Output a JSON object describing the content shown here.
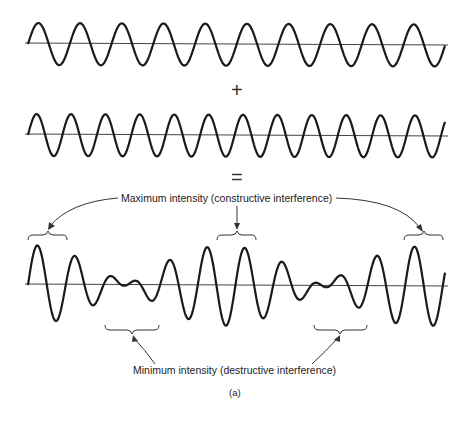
{
  "figure": {
    "operator_plus": "+",
    "operator_equals": "=",
    "max_label": "Maximum intensity (constructive interference)",
    "min_label": "Minimum intensity (destructive interference)",
    "caption": "(a)"
  },
  "waves": {
    "x_start": 28,
    "x_end": 445,
    "wave1": {
      "baseline_y": 44,
      "amplitude": 21,
      "period": 41.7
    },
    "wave2": {
      "baseline_y": 135,
      "amplitude": 21,
      "period": 34.4
    },
    "sum": {
      "baseline_y": 285,
      "amplitude_each": 20
    }
  },
  "colors": {
    "line": "#1a1a1a",
    "axis": "#444444"
  }
}
